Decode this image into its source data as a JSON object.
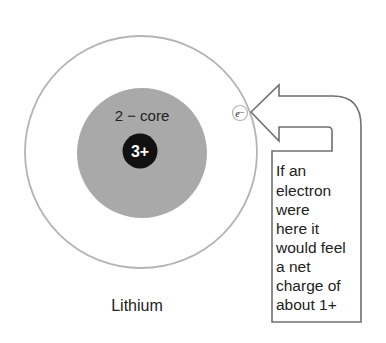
{
  "diagram": {
    "atom_label": "Lithium",
    "core_label": "2 − core",
    "nucleus_label": "3+",
    "electron_label": "e⁻",
    "callout_lines": [
      "If an",
      "electron",
      "were",
      "here it",
      "would feel",
      "a net",
      "charge of",
      "about 1+"
    ],
    "colors": {
      "outer_shell_stroke": "#b4b4b4",
      "core_fill": "#a9a9a9",
      "nucleus_fill": "#111111",
      "nucleus_text": "#ffffff",
      "arrow_stroke": "#707070",
      "text": "#222222"
    }
  }
}
